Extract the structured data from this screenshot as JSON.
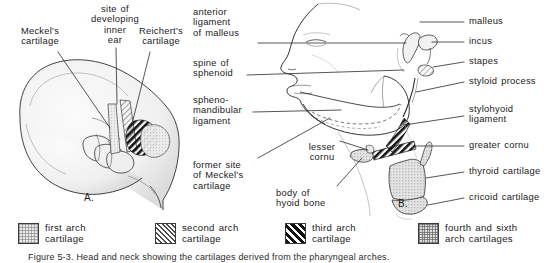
{
  "figure": {
    "panel_a_id": "A.",
    "panel_b_id": "B."
  },
  "panel_a": {
    "title_hint": "embryo lateral view",
    "labels": [
      {
        "id": "meckels-cartilage",
        "text": "Meckel's\ncartilage"
      },
      {
        "id": "site-inner-ear",
        "text": "site of\ndeveloping\ninner\near"
      },
      {
        "id": "reicherts-cartilage",
        "text": "Reichert's\ncartilage"
      }
    ]
  },
  "panel_b": {
    "title_hint": "adult head lateral view with hyoid and laryngeal cartilages",
    "labels_left": [
      {
        "id": "anterior-ligament-of-malleus",
        "text": "anterior\nligament\nof malleus"
      },
      {
        "id": "spine-of-sphenoid",
        "text": "spine of\nsphenoid"
      },
      {
        "id": "sphenomandibular-ligament",
        "text": "spheno-\nmandibular\nligament"
      },
      {
        "id": "former-site-of-meckels-cartilage",
        "text": "former site\nof Meckel's\ncartilage"
      }
    ],
    "labels_center": [
      {
        "id": "lesser-cornu",
        "text": "lesser\ncornu"
      },
      {
        "id": "body-of-hyoid-bone",
        "text": "body of\nhyoid bone"
      }
    ],
    "labels_right": [
      {
        "id": "malleus",
        "text": "malleus"
      },
      {
        "id": "incus",
        "text": "incus"
      },
      {
        "id": "stapes",
        "text": "stapes"
      },
      {
        "id": "styloid-process",
        "text": "styloid process"
      },
      {
        "id": "stylohyoid-ligament",
        "text": "stylohyoid\nligament"
      },
      {
        "id": "greater-cornu",
        "text": "greater cornu"
      },
      {
        "id": "thyroid-cartilage",
        "text": "thyroid cartilage"
      },
      {
        "id": "cricoid-cartilage",
        "text": "cricoid cartilage"
      }
    ]
  },
  "legend": {
    "items": [
      {
        "id": "first-arch",
        "swatch": "light-stipple",
        "text": "first arch\ncartilage"
      },
      {
        "id": "second-arch",
        "swatch": "fine-diagonal",
        "text": "second arch\ncartilage"
      },
      {
        "id": "third-arch",
        "swatch": "bold-diagonal",
        "text": "third arch\ncartilage"
      },
      {
        "id": "fourth-sixth-arch",
        "swatch": "dense-stipple",
        "text": "fourth and sixth\narch cartilages"
      }
    ]
  },
  "caption": {
    "text": "Figure 5-3.  Head and neck showing the cartilages derived from the pharyngeal arches."
  },
  "colors": {
    "ink": "#1b1b1b",
    "line": "#3a3a3a",
    "background": "#ffffff",
    "shade_light": "#e9e9e9",
    "shade_dark": "#111111"
  }
}
